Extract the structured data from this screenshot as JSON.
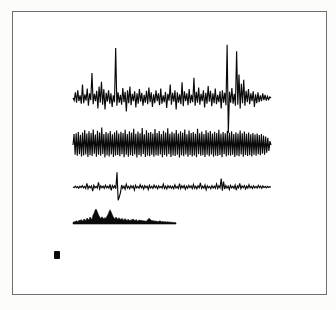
{
  "figure": {
    "background_color": "#ffffff",
    "paper_color": "#fcfcfb",
    "frame": {
      "label": "plot-frame",
      "x": 12,
      "y": 11,
      "width": 315,
      "height": 284,
      "border_color": "#6e6e6e",
      "border_width": 1
    },
    "marker": {
      "label": "solid-square-marker",
      "x": 54,
      "y": 251,
      "width": 6,
      "height": 8,
      "color": "#0b0b0b"
    },
    "ink_color": "#0a0a0a"
  },
  "chart_data": {
    "type": "line",
    "subtitle": "",
    "xlabel": "",
    "ylabel": "",
    "grid": false,
    "legend": "none",
    "axis_visible": false,
    "x_range": [
      0,
      1
    ],
    "series": [
      {
        "name": "trace-1-spiky-noise",
        "render": "line",
        "baseline_y": 98,
        "x_start": 73,
        "x_end": 271,
        "amplitude_scale": 26,
        "stroke": "#0a0a0a",
        "description": "Irregular noisy waveform with several tall narrow positive spikes and one deep negative spike",
        "values": [
          0.0,
          -0.1,
          0.22,
          -0.18,
          0.3,
          -0.12,
          0.1,
          -0.22,
          0.52,
          -0.2,
          0.14,
          -0.1,
          0.36,
          -0.3,
          0.18,
          -0.08,
          0.96,
          -0.24,
          0.16,
          -0.12,
          0.28,
          -0.4,
          0.44,
          -0.18,
          0.62,
          -0.26,
          0.34,
          -0.44,
          0.2,
          -0.14,
          0.3,
          -0.22,
          0.18,
          -0.34,
          0.1,
          -0.16,
          1.92,
          -0.3,
          0.22,
          -0.18,
          0.12,
          -0.26,
          0.38,
          -0.16,
          0.24,
          -0.52,
          0.3,
          -0.2,
          0.44,
          -0.28,
          0.16,
          -0.12,
          0.26,
          -0.36,
          0.18,
          -0.22,
          0.34,
          -0.14,
          0.2,
          -0.3,
          0.12,
          -0.18,
          0.28,
          -0.24,
          0.4,
          -0.16,
          0.22,
          -0.34,
          0.14,
          -0.2,
          0.3,
          -0.12,
          0.18,
          -0.28,
          0.36,
          -0.22,
          0.1,
          -0.16,
          0.24,
          -0.38,
          0.16,
          -0.1,
          0.52,
          -0.26,
          0.2,
          -0.14,
          0.3,
          -0.44,
          0.22,
          -0.18,
          0.14,
          -0.24,
          0.6,
          -0.32,
          0.26,
          -0.12,
          0.18,
          -0.28,
          0.34,
          -0.2,
          0.12,
          -0.16,
          0.78,
          -0.3,
          0.24,
          -0.18,
          0.4,
          -0.26,
          0.16,
          -0.12,
          0.3,
          -0.36,
          0.2,
          -0.22,
          0.46,
          -0.14,
          0.28,
          -0.32,
          0.18,
          -0.2,
          0.36,
          -0.24,
          0.12,
          -0.16,
          0.26,
          -0.4,
          0.3,
          -0.18,
          0.2,
          -0.28,
          2.05,
          -1.35,
          0.24,
          -0.18,
          0.38,
          -0.22,
          0.16,
          -0.3,
          1.8,
          -0.26,
          0.9,
          -0.4,
          0.55,
          -0.2,
          0.7,
          -0.3,
          0.28,
          -0.16,
          0.34,
          -0.24,
          0.18,
          -0.12,
          0.26,
          -0.34,
          0.14,
          -0.2,
          0.22,
          -0.16,
          0.1,
          -0.12,
          0.18,
          -0.08,
          0.12,
          -0.1,
          0.06,
          -0.06,
          0.04,
          0.0
        ]
      },
      {
        "name": "trace-2-dense-oscillation",
        "render": "line",
        "baseline_y": 145,
        "x_start": 73,
        "x_end": 271,
        "amplitude_scale": 13,
        "stroke": "#0a0a0a",
        "description": "Dense high-frequency oscillation of roughly uniform amplitude across the full width",
        "values": [
          0.0,
          0.85,
          -0.75,
          0.9,
          -0.82,
          1.0,
          -0.7,
          0.78,
          -0.88,
          0.95,
          -0.8,
          1.15,
          -0.72,
          0.88,
          -0.92,
          1.05,
          -0.78,
          0.92,
          -0.85,
          1.2,
          -0.68,
          0.8,
          -0.9,
          1.1,
          -0.75,
          0.95,
          -0.82,
          1.35,
          -0.7,
          0.85,
          -0.95,
          1.0,
          -0.78,
          0.9,
          -0.88,
          1.08,
          -0.72,
          0.82,
          -0.92,
          0.98,
          -0.8,
          1.12,
          -0.76,
          0.88,
          -0.86,
          1.02,
          -0.7,
          0.92,
          -0.94,
          1.18,
          -0.74,
          0.84,
          -0.9,
          1.06,
          -0.78,
          0.96,
          -0.84,
          1.25,
          -0.72,
          0.86,
          -0.96,
          1.04,
          -0.76,
          0.9,
          -0.88,
          1.3,
          -0.7,
          0.82,
          -0.92,
          1.14,
          -0.8,
          0.94,
          -0.86,
          1.0,
          -0.74,
          0.88,
          -0.9,
          1.22,
          -0.78,
          0.92,
          -0.82,
          1.08,
          -0.72,
          0.84,
          -0.94,
          1.1,
          -0.76,
          0.96,
          -0.88,
          1.28,
          -0.7,
          0.86,
          -0.92,
          1.02,
          -0.8,
          0.9,
          -0.84,
          1.16,
          -0.74,
          0.88,
          -0.96,
          1.06,
          -0.78,
          0.94,
          -0.86,
          1.2,
          -0.72,
          0.82,
          -0.9,
          1.12,
          -0.76,
          0.92,
          -0.88,
          1.0,
          -0.8,
          0.86,
          -0.94,
          1.24,
          -0.7,
          0.9,
          -0.82,
          1.04,
          -0.78,
          0.84,
          -0.92,
          1.14,
          -0.74,
          0.96,
          -0.86,
          1.08,
          -0.72,
          0.88,
          -0.9,
          1.02,
          -0.8,
          0.92,
          -0.84,
          1.18,
          -0.76,
          0.86,
          -0.94,
          1.0,
          -0.7,
          0.9,
          -0.88,
          1.1,
          -0.78,
          0.94,
          -0.82,
          1.06,
          -0.74,
          0.84,
          -0.92,
          0.98,
          -0.8,
          0.88,
          -0.86,
          1.12,
          -0.72,
          0.9,
          -0.9,
          1.04,
          -0.76,
          0.86,
          -0.84,
          0.96,
          -0.78,
          0.82,
          -0.88,
          0.92,
          -0.74,
          0.8,
          -0.82,
          0.88,
          -0.7,
          0.76,
          -0.78,
          0.84,
          -0.68,
          0.72,
          -0.74,
          0.66,
          -0.6,
          0.55,
          -0.45,
          0.3,
          0.0
        ]
      },
      {
        "name": "trace-3-flat-with-spikes",
        "render": "line",
        "baseline_y": 187,
        "x_start": 73,
        "x_end": 271,
        "amplitude_scale": 14,
        "stroke": "#0a0a0a",
        "description": "Nearly flat baseline punctuated by one large biphasic spike near the left third and scattered small events",
        "values": [
          0.0,
          -0.04,
          0.06,
          -0.05,
          0.03,
          -0.08,
          0.05,
          -0.04,
          0.1,
          -0.06,
          0.04,
          -0.1,
          0.26,
          -0.12,
          0.06,
          -0.05,
          0.08,
          -0.3,
          0.12,
          -0.06,
          0.04,
          -0.08,
          0.34,
          -0.14,
          0.08,
          -0.05,
          0.06,
          -0.1,
          0.12,
          -0.06,
          0.05,
          -0.08,
          0.18,
          -0.24,
          0.1,
          -0.06,
          0.08,
          -0.12,
          1.05,
          -0.95,
          -0.7,
          -0.4,
          0.14,
          -0.1,
          0.06,
          -0.16,
          0.2,
          -0.08,
          0.05,
          -0.12,
          0.1,
          -0.06,
          0.08,
          -0.22,
          0.12,
          -0.07,
          0.04,
          -0.09,
          0.16,
          -0.06,
          0.08,
          -0.14,
          0.1,
          -0.05,
          0.06,
          -0.18,
          0.12,
          -0.08,
          0.05,
          -0.1,
          0.14,
          -0.06,
          0.07,
          -0.12,
          0.09,
          -0.05,
          0.04,
          -0.08,
          0.2,
          -0.1,
          0.06,
          -0.14,
          0.1,
          -0.06,
          0.08,
          -0.09,
          0.05,
          -0.12,
          0.16,
          -0.07,
          0.04,
          -0.1,
          0.24,
          -0.12,
          0.08,
          -0.06,
          0.1,
          -0.16,
          0.06,
          -0.08,
          0.12,
          -0.05,
          0.07,
          -0.11,
          0.18,
          -0.09,
          0.05,
          -0.13,
          0.08,
          -0.06,
          0.3,
          -0.1,
          0.06,
          -0.08,
          0.14,
          -0.2,
          0.09,
          -0.05,
          0.04,
          -0.12,
          0.1,
          -0.07,
          0.06,
          -0.09,
          0.22,
          -0.11,
          0.08,
          -0.06,
          0.6,
          -0.26,
          0.38,
          -0.14,
          0.1,
          -0.08,
          0.06,
          -0.18,
          0.12,
          -0.06,
          0.05,
          -0.1,
          0.14,
          -0.22,
          0.08,
          -0.06,
          0.26,
          -0.12,
          0.07,
          -0.05,
          0.1,
          -0.14,
          0.06,
          -0.08,
          0.16,
          -0.06,
          0.05,
          -0.1,
          0.09,
          -0.07,
          0.04,
          -0.08,
          0.12,
          -0.05,
          0.06,
          -0.09,
          0.08,
          -0.04,
          0.05,
          -0.06,
          0.04,
          -0.03,
          0.02,
          0.0
        ]
      },
      {
        "name": "trace-4-filled-envelope",
        "render": "filled-area",
        "baseline_y": 224,
        "x_start": 73,
        "x_end": 176,
        "amplitude_scale": 15,
        "fill": "#0a0a0a",
        "description": "Solid filled envelope plot, shorter than the other traces, with two prominent humps in the left half",
        "values": [
          0.1,
          0.16,
          0.12,
          0.22,
          0.18,
          0.14,
          0.26,
          0.2,
          0.3,
          0.24,
          0.18,
          0.34,
          0.28,
          0.22,
          0.4,
          0.32,
          0.26,
          0.46,
          0.38,
          0.3,
          0.58,
          0.72,
          0.9,
          1.0,
          0.86,
          0.7,
          0.54,
          0.44,
          0.36,
          0.48,
          0.4,
          0.32,
          0.44,
          0.36,
          0.52,
          0.64,
          0.8,
          0.95,
          0.82,
          0.66,
          0.5,
          0.4,
          0.34,
          0.46,
          0.38,
          0.3,
          0.42,
          0.34,
          0.28,
          0.38,
          0.3,
          0.24,
          0.36,
          0.28,
          0.22,
          0.32,
          0.26,
          0.2,
          0.3,
          0.24,
          0.34,
          0.28,
          0.22,
          0.3,
          0.24,
          0.18,
          0.28,
          0.22,
          0.26,
          0.2,
          0.24,
          0.18,
          0.22,
          0.16,
          0.24,
          0.3,
          0.38,
          0.32,
          0.26,
          0.2,
          0.24,
          0.18,
          0.22,
          0.16,
          0.2,
          0.14,
          0.18,
          0.22,
          0.16,
          0.14,
          0.18,
          0.12,
          0.16,
          0.14,
          0.12,
          0.16,
          0.1,
          0.14,
          0.12,
          0.1,
          0.12,
          0.08,
          0.1,
          0.08
        ]
      }
    ]
  },
  "accessibility": {
    "alt_text": "Scanned figure showing four stacked horizontal signal traces inside a thin rectangular border, with a small solid black square below and to the left of the traces."
  }
}
